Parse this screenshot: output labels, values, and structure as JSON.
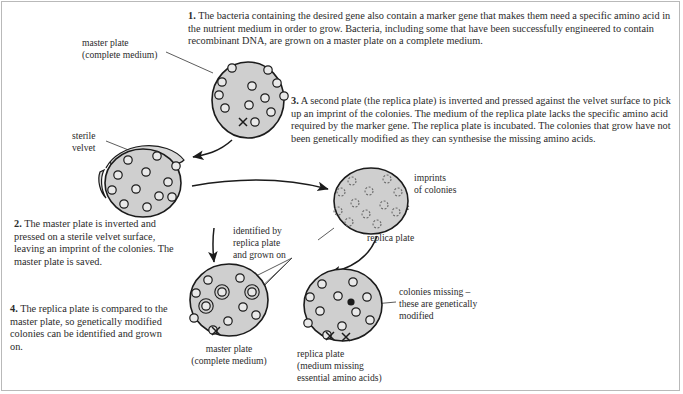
{
  "figure": {
    "colors": {
      "plate_fill": "#cfcfcf",
      "plate_stroke": "#1b1b1b",
      "colony_fill": "#e9e9e9",
      "velvet_fill": "#d8d8d8",
      "text": "#2b2b2b",
      "frame": "#b9b9b9",
      "background": "#ffffff"
    }
  },
  "steps": [
    {
      "number": "1.",
      "text": "The bacteria containing the desired gene also contain a marker gene that makes them need a specific amino acid in the nutrient medium in order to grow. Bacteria, including some that have been successfully engineered to contain recombinant DNA, are grown on a master plate on a complete medium."
    },
    {
      "number": "2.",
      "text": "The master plate is inverted and pressed on a sterile velvet surface, leaving an imprint of the colonies. The master plate is saved."
    },
    {
      "number": "3.",
      "text": "A second plate (the replica plate) is inverted and pressed against the velvet surface to pick up an imprint of the colonies. The medium of the replica plate lacks the specific amino acid required by the marker gene. The replica plate is incubated. The colonies that grow have not been genetically modified as they can synthesise the missing amino acids."
    },
    {
      "number": "4.",
      "text": "The replica plate is compared to the master plate, so genetically modified colonies can be identified and grown on."
    }
  ],
  "labels": {
    "master_plate_top": "master plate\n(complete medium)",
    "master_plate_top_line1": "master plate",
    "master_plate_top_line2": "(complete medium)",
    "sterile_velvet_line1": "sterile",
    "sterile_velvet_line2": "velvet",
    "identified_line1": "identified by",
    "identified_line2": "replica plate",
    "identified_line3": "and grown on",
    "imprints_line1": "imprints",
    "imprints_line2": "of colonies",
    "replica_plate_mid": "replica plate",
    "colonies_missing_line1": "colonies missing –",
    "colonies_missing_line2": "these are genetically",
    "colonies_missing_line3": "modified",
    "master_plate_bottom_line1": "master plate",
    "master_plate_bottom_line2": "(complete medium)",
    "replica_plate_bottom_line1": "replica plate",
    "replica_plate_bottom_line2": "(medium missing",
    "replica_plate_bottom_line3": "essential amino acids)"
  },
  "plates": {
    "master_top": {
      "name": "master plate (top)",
      "cx": 248,
      "cy": 100,
      "rx": 36,
      "ry": 38,
      "colony_style": "solid",
      "colonies": [
        {
          "x": 232,
          "y": 68,
          "r": 4.2
        },
        {
          "x": 268,
          "y": 70,
          "r": 4.2
        },
        {
          "x": 222,
          "y": 82,
          "r": 4.2
        },
        {
          "x": 252,
          "y": 86,
          "r": 4.2
        },
        {
          "x": 277,
          "y": 83,
          "r": 4.2
        },
        {
          "x": 219,
          "y": 95,
          "r": 4.2
        },
        {
          "x": 265,
          "y": 98,
          "r": 4.2
        },
        {
          "x": 284,
          "y": 96,
          "r": 4.2
        },
        {
          "x": 225,
          "y": 108,
          "r": 4.2
        },
        {
          "x": 249,
          "y": 105,
          "r": 4.2
        },
        {
          "x": 271,
          "y": 112,
          "r": 4.2
        },
        {
          "x": 255,
          "y": 122,
          "r": 4.2
        }
      ],
      "marks": [
        {
          "x": 243,
          "y": 122,
          "glyph": "x"
        }
      ]
    },
    "velvet_plate": {
      "name": "master plate pressed on sterile velvet",
      "cx": 143,
      "cy": 183,
      "rx": 38,
      "ry": 34,
      "colony_style": "solid",
      "colonies": [
        {
          "x": 128,
          "y": 160,
          "r": 4.2
        },
        {
          "x": 157,
          "y": 156,
          "r": 4.2
        },
        {
          "x": 176,
          "y": 166,
          "r": 4.2
        },
        {
          "x": 118,
          "y": 175,
          "r": 4.2
        },
        {
          "x": 146,
          "y": 172,
          "r": 4.2
        },
        {
          "x": 168,
          "y": 182,
          "r": 4.2
        },
        {
          "x": 112,
          "y": 190,
          "r": 4.2
        },
        {
          "x": 136,
          "y": 189,
          "r": 4.2
        },
        {
          "x": 159,
          "y": 196,
          "r": 4.2
        },
        {
          "x": 124,
          "y": 204,
          "r": 4.2
        },
        {
          "x": 147,
          "y": 207,
          "r": 4.2
        },
        {
          "x": 172,
          "y": 197,
          "r": 4.2
        }
      ],
      "marks": []
    },
    "replica_mid": {
      "name": "replica plate with imprints of colonies",
      "cx": 371,
      "cy": 201,
      "rx": 37,
      "ry": 33,
      "colony_style": "dashed",
      "colonies": [
        {
          "x": 352,
          "y": 181,
          "r": 4.0
        },
        {
          "x": 387,
          "y": 179,
          "r": 4.0
        },
        {
          "x": 341,
          "y": 192,
          "r": 4.0
        },
        {
          "x": 369,
          "y": 191,
          "r": 4.0
        },
        {
          "x": 398,
          "y": 192,
          "r": 4.0
        },
        {
          "x": 355,
          "y": 203,
          "r": 4.0
        },
        {
          "x": 384,
          "y": 205,
          "r": 4.0
        },
        {
          "x": 338,
          "y": 211,
          "r": 4.0
        },
        {
          "x": 366,
          "y": 214,
          "r": 4.0
        },
        {
          "x": 396,
          "y": 212,
          "r": 4.0
        },
        {
          "x": 349,
          "y": 222,
          "r": 4.0
        },
        {
          "x": 377,
          "y": 224,
          "r": 4.0
        }
      ],
      "marks": []
    },
    "master_bottom": {
      "name": "master plate (bottom, colonies identified)",
      "cx": 229,
      "cy": 300,
      "rx": 39,
      "ry": 36,
      "colony_style": "solid",
      "colonies": [
        {
          "x": 208,
          "y": 280,
          "r": 4.2
        },
        {
          "x": 240,
          "y": 278,
          "r": 4.2
        },
        {
          "x": 196,
          "y": 293,
          "r": 4.2
        },
        {
          "x": 222,
          "y": 292,
          "r": 4.2,
          "ringed": true
        },
        {
          "x": 252,
          "y": 292,
          "r": 4.2,
          "ringed": true
        },
        {
          "x": 206,
          "y": 306,
          "r": 4.2,
          "ringed": true
        },
        {
          "x": 243,
          "y": 307,
          "r": 4.2
        },
        {
          "x": 194,
          "y": 318,
          "r": 4.2
        },
        {
          "x": 228,
          "y": 321,
          "r": 4.2
        },
        {
          "x": 256,
          "y": 315,
          "r": 4.2
        },
        {
          "x": 213,
          "y": 330,
          "r": 4.2
        }
      ],
      "marks": [
        {
          "x": 216,
          "y": 331,
          "glyph": "x"
        }
      ]
    },
    "replica_bottom": {
      "name": "replica plate (medium missing essential amino acids)",
      "cx": 343,
      "cy": 305,
      "rx": 39,
      "ry": 36,
      "colony_style": "solid",
      "colonies": [
        {
          "x": 322,
          "y": 284,
          "r": 4.2
        },
        {
          "x": 353,
          "y": 282,
          "r": 4.2
        },
        {
          "x": 310,
          "y": 297,
          "r": 4.2
        },
        {
          "x": 338,
          "y": 296,
          "r": 4.2
        },
        {
          "x": 367,
          "y": 297,
          "r": 4.2
        },
        {
          "x": 320,
          "y": 311,
          "r": 4.2
        },
        {
          "x": 356,
          "y": 312,
          "r": 4.2
        },
        {
          "x": 308,
          "y": 323,
          "r": 4.2
        },
        {
          "x": 342,
          "y": 326,
          "r": 4.2
        },
        {
          "x": 370,
          "y": 320,
          "r": 4.2
        },
        {
          "x": 327,
          "y": 335,
          "r": 4.2
        }
      ],
      "filled_colonies": [
        {
          "x": 351,
          "y": 302,
          "r": 3.6
        }
      ],
      "marks": [
        {
          "x": 330,
          "y": 336,
          "glyph": "x"
        },
        {
          "x": 346,
          "y": 337,
          "glyph": "x"
        }
      ]
    }
  }
}
